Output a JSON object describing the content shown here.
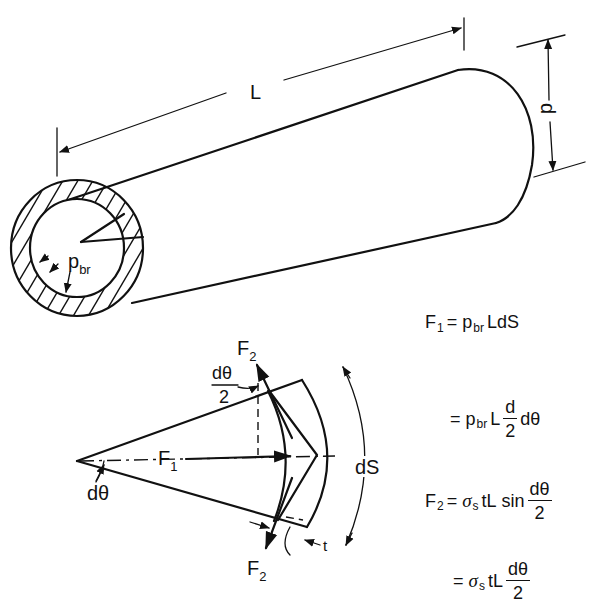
{
  "figure": {
    "cylinder": {
      "length_label": "L",
      "diameter_label": "d",
      "pressure_label": "p",
      "pressure_subscript": "br"
    },
    "free_body": {
      "force1_label": "F",
      "force1_subscript": "1",
      "force2_top_label": "F",
      "force2_top_subscript": "2",
      "force2_bottom_label": "F",
      "force2_bottom_subscript": "2",
      "half_angle_num": "dθ",
      "half_angle_den": "2",
      "angle_label": "dθ",
      "arc_label": "dS",
      "thickness_label": "t"
    }
  },
  "equations": [
    {
      "lhs": "F",
      "lhs_sub": "1",
      "eq": "=",
      "p": "p",
      "p_sub": "br",
      "rest": "LdS"
    },
    {
      "eq": "=",
      "p": "p",
      "p_sub": "br",
      "L": "L",
      "frac_num": "d",
      "frac_den": "2",
      "tail": "dθ"
    },
    {
      "lhs": "F",
      "lhs_sub": "2",
      "eq": "=",
      "sigma": "σ",
      "sigma_sub": "s",
      "tL": "tL",
      "sin": "sin",
      "frac_num": "dθ",
      "frac_den": "2"
    },
    {
      "eq": "=",
      "sigma": "σ",
      "sigma_sub": "s",
      "tL": "tL",
      "frac_num": "dθ",
      "frac_den": "2"
    }
  ]
}
